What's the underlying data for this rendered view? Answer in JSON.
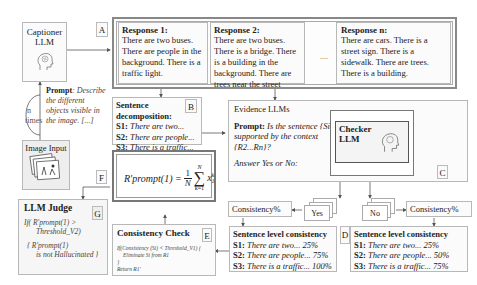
{
  "captioner": {
    "title_line1": "Captioner",
    "title_line2": "LLM"
  },
  "labels": {
    "A": "A",
    "B": "B",
    "C": "C",
    "D": "D",
    "E": "E",
    "F": "F",
    "G": "G"
  },
  "loop": {
    "n": "n",
    "times": "times"
  },
  "prompt_caption": {
    "label": "Prompt",
    "text": ": Describe the different objects visible in the image. [...]"
  },
  "image_input": {
    "title": "Image Input"
  },
  "responses": [
    {
      "title": "Response 1:",
      "text": "There are two buses. There are people in the background. There is a traffic light."
    },
    {
      "title": "Response 2:",
      "text": "There are two buses. There is a bridge. There is a building in the background. There are trees near the street"
    },
    {
      "title": "Response n:",
      "text": "There are cars. There is a street sign. There is a sidewalk. There are trees. There is a building."
    }
  ],
  "ellipsis": "....",
  "decomposition": {
    "title_line1": "Sentence",
    "title_line2": "decomposition:",
    "items": [
      {
        "id": "S1:",
        "text": "There are two..."
      },
      {
        "id": "S2:",
        "text": "There are people..."
      },
      {
        "id": "S3:",
        "text": "There is a traffic..."
      }
    ]
  },
  "evidence": {
    "title": "Evidence LLMs",
    "prompt_label": "Prompt:",
    "prompt_text": "Is the sentence {Si} supported by the context {R2...Rn}?",
    "answer": "Answer Yes or No:"
  },
  "checker": {
    "line1": "Checker",
    "line2": "LLM"
  },
  "yes_label": "Yes",
  "no_label": "No",
  "consistency_pct": "Consistency%",
  "sentence_consistency_yes": {
    "title": "Sentence level consistency",
    "items": [
      {
        "id": "S1:",
        "text": "There are two... 25%"
      },
      {
        "id": "S2:",
        "text": "There are people... 75%"
      },
      {
        "id": "S3:",
        "text": "There is a traffic... 100%"
      }
    ]
  },
  "sentence_consistency_no": {
    "title": "Sentence level consistency",
    "items": [
      {
        "id": "S1:",
        "text": "There are two... 25%"
      },
      {
        "id": "S2:",
        "text": "There are people... 50%"
      },
      {
        "id": "S3:",
        "text": "There is a traffic... 75%"
      }
    ]
  },
  "formula": {
    "lhs": "R′prompt(1) =",
    "frac_num": "1",
    "frac_den": "N",
    "sum_top": "N",
    "sum_bottom": "k=1",
    "term": "x",
    "term_sup": "k",
    "term_sub": "1"
  },
  "consistency_check": {
    "title": "Consistency Check",
    "code_line1": "If(Consistency (Si) < Threshold_V1) {",
    "code_line2": "Eliminate Si from R1",
    "code_line3": "}",
    "code_line4": "Return R1'"
  },
  "judge": {
    "title": "LLM Judge",
    "line1": "If( R′prompt(1) >",
    "line2": "Threshold_V2)",
    "line3": "{ R′prompt(1)",
    "line4": "is not Hallucinated }"
  }
}
